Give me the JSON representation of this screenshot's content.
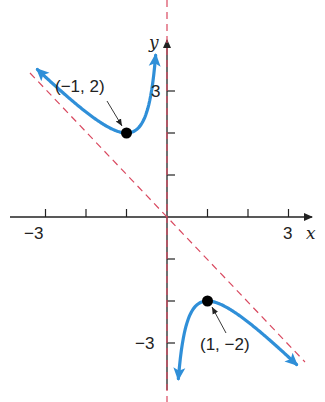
{
  "chart_data": {
    "type": "line",
    "title": "",
    "xlabel": "x",
    "ylabel": "y",
    "function": "y = -x - 1/x",
    "xlim": [
      -3.3,
      3.4
    ],
    "ylim": [
      -3.8,
      4.1
    ],
    "grid": false,
    "x_ticks": [
      -3,
      -2,
      -1,
      1,
      2,
      3
    ],
    "y_ticks": [
      -3,
      -2,
      -1,
      1,
      2,
      3
    ],
    "x_tick_labels": [
      {
        "value": -3,
        "label": "−3"
      },
      {
        "value": 3,
        "label": "3"
      }
    ],
    "y_tick_labels": [
      {
        "value": 3,
        "label": "3"
      },
      {
        "value": -3,
        "label": "−3"
      }
    ],
    "asymptotes": [
      {
        "type": "vertical",
        "equation": "x = 0",
        "style": "dashed",
        "color": "#d9485f"
      },
      {
        "type": "oblique",
        "equation": "y = -x",
        "style": "dashed",
        "color": "#d9485f"
      }
    ],
    "series": [
      {
        "name": "left branch",
        "color": "#2f8fd8",
        "x_range": [
          -3.2,
          -0.28
        ],
        "both_ends_arrows": true
      },
      {
        "name": "right branch",
        "color": "#2f8fd8",
        "x_range": [
          0.28,
          3.2
        ],
        "both_ends_arrows": true
      }
    ],
    "annotations": [
      {
        "point": [
          -1,
          2
        ],
        "label": "(−1, 2)"
      },
      {
        "point": [
          1,
          -2
        ],
        "label": "(1, −2)"
      }
    ]
  },
  "labels": {
    "x_axis": "x",
    "y_axis": "y",
    "x_neg3": "−3",
    "x_pos3": "3",
    "y_pos3": "3",
    "y_neg3": "−3",
    "point_left": "(−1, 2)",
    "point_right": "(1, −2)"
  },
  "colors": {
    "curve": "#2f8fd8",
    "asymptote": "#d9485f",
    "axis": "#222222",
    "point": "#000000"
  }
}
